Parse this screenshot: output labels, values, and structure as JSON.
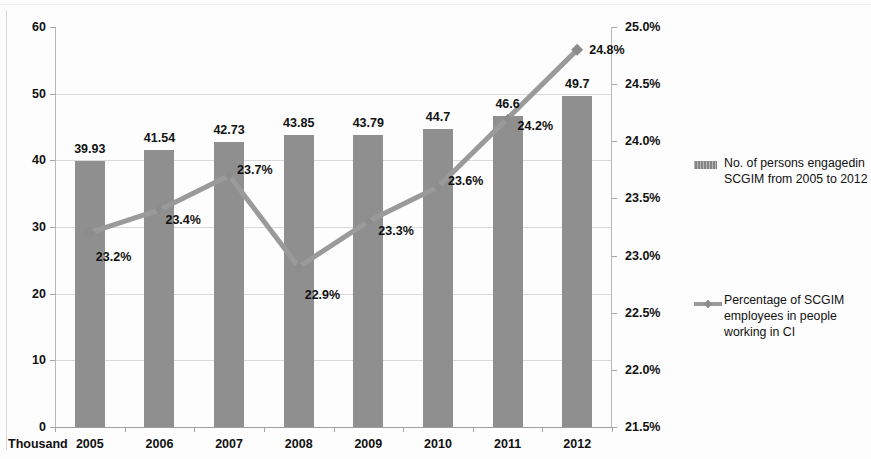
{
  "chart_data": {
    "type": "bar",
    "title": "",
    "subtitle": "",
    "xlabel": "",
    "unit_label": "Thousand",
    "categories": [
      "2005",
      "2006",
      "2007",
      "2008",
      "2009",
      "2010",
      "2011",
      "2012"
    ],
    "grid": true,
    "legend_position": "right",
    "series": [
      {
        "name": "No. of persons engagedin SCGIM from 2005 to 2012",
        "type": "bar",
        "axis": "left",
        "color": "#8f8f8f",
        "values": [
          39.93,
          41.54,
          42.73,
          43.85,
          43.79,
          44.7,
          46.6,
          49.7
        ],
        "value_labels": [
          "39.93",
          "41.54",
          "42.73",
          "43.85",
          "43.79",
          "44.7",
          "46.6",
          "49.7"
        ]
      },
      {
        "name": "Percentage of SCGIM employees in people working in CI",
        "type": "line",
        "axis": "right",
        "color": "#9a9a9a",
        "marker": "diamond",
        "values": [
          23.2,
          23.4,
          23.7,
          22.9,
          23.3,
          23.6,
          24.2,
          24.8
        ],
        "value_labels": [
          "23.2%",
          "23.4%",
          "23.7%",
          "22.9%",
          "23.3%",
          "23.6%",
          "24.2%",
          "24.8%"
        ]
      }
    ],
    "yaxis_left": {
      "label": "",
      "ylim": [
        0,
        60
      ],
      "ticks": [
        0,
        10,
        20,
        30,
        40,
        50,
        60
      ],
      "tick_labels": [
        "0",
        "10",
        "20",
        "30",
        "40",
        "50",
        "60"
      ]
    },
    "yaxis_right": {
      "label": "",
      "ylim": [
        21.5,
        25.0
      ],
      "ticks": [
        21.5,
        22.0,
        22.5,
        23.0,
        23.5,
        24.0,
        24.5,
        25.0
      ],
      "tick_labels": [
        "21.5%",
        "22.0%",
        "22.5%",
        "23.0%",
        "23.5%",
        "24.0%",
        "24.5%",
        "25.0%"
      ]
    }
  },
  "legend": {
    "bars": {
      "line1": "No. of persons engagedin",
      "line2": "SCGIM from 2005 to 2012"
    },
    "line": {
      "line1": "Percentage of SCGIM",
      "line2": "employees in people",
      "line3": "working in CI"
    }
  }
}
